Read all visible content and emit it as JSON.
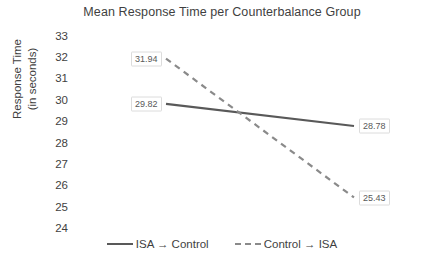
{
  "chart_data": {
    "type": "line",
    "title": "Mean Response Time per Counterbalance Group",
    "xlabel": "",
    "ylabel": "Response Time (in seconds)",
    "ylabel_line1": "Response Time",
    "ylabel_line2": "(in seconds)",
    "ylim": [
      24,
      33
    ],
    "yticks": [
      33,
      32,
      31,
      30,
      29,
      28,
      27,
      26,
      25,
      24
    ],
    "ytick_labels": [
      "33",
      "32",
      "31",
      "30",
      "29",
      "28",
      "27",
      "26",
      "25",
      "24"
    ],
    "grid": false,
    "axis_lines": false,
    "x": [
      "Block 1",
      "Block 2"
    ],
    "xtick_labels": [
      "",
      ""
    ],
    "legend_position": "bottom-center",
    "series": [
      {
        "name": "ISA → Control",
        "style": "solid",
        "color": "#595959",
        "values": [
          29.82,
          28.78
        ],
        "point_labels": [
          "29.82",
          "28.78"
        ]
      },
      {
        "name": "Control → ISA",
        "style": "dashed",
        "color": "#808080",
        "values": [
          31.94,
          25.43
        ],
        "point_labels": [
          "31.94",
          "25.43"
        ]
      }
    ],
    "data_labels": [
      {
        "text": "31.94",
        "series": "Control → ISA",
        "value": 31.94,
        "position": "left"
      },
      {
        "text": "29.82",
        "series": "ISA → Control",
        "value": 29.82,
        "position": "left"
      },
      {
        "text": "28.78",
        "series": "ISA → Control",
        "value": 28.78,
        "position": "right"
      },
      {
        "text": "25.43",
        "series": "Control → ISA",
        "value": 25.43,
        "position": "right"
      }
    ]
  },
  "legend": {
    "items": [
      {
        "label": "ISA → Control",
        "style": "solid",
        "color": "#595959"
      },
      {
        "label": "Control → ISA",
        "style": "dashed",
        "color": "#808080"
      }
    ]
  },
  "colors": {
    "text": "#3f3f3f",
    "series_solid": "#595959",
    "series_dashed": "#808080",
    "label_border": "#dcdcdc",
    "background": "#ffffff"
  }
}
